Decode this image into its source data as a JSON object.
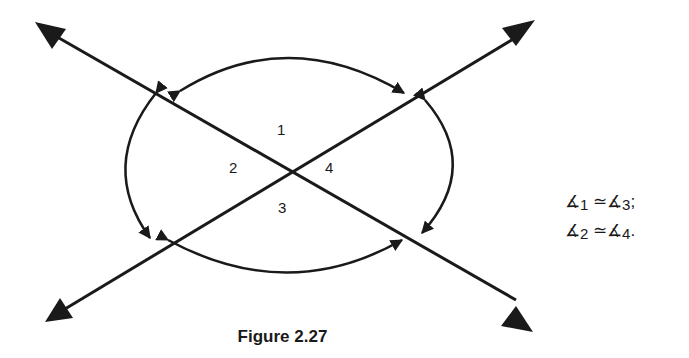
{
  "figure": {
    "caption": "Figure 2.27",
    "angle_labels": [
      "1",
      "2",
      "3",
      "4"
    ],
    "statements": [
      {
        "angle_a": "1",
        "angle_b": "3",
        "terminator": ";"
      },
      {
        "angle_a": "2",
        "angle_b": "4",
        "terminator": "."
      }
    ],
    "symbols": {
      "angle": "∡",
      "congruent": "≃"
    },
    "colors": {
      "stroke": "#1a1a1a",
      "background": "#ffffff"
    }
  }
}
